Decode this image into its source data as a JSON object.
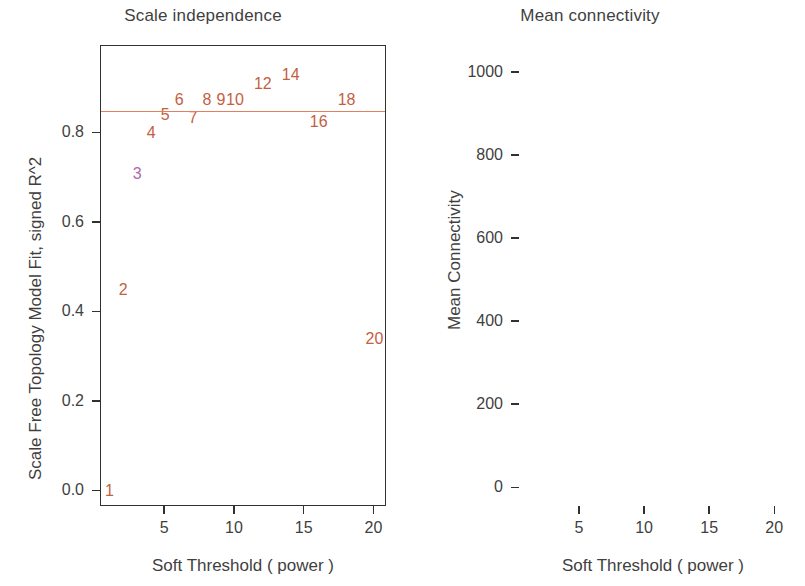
{
  "figure": {
    "width": 805,
    "height": 586,
    "point_color": "#c4603f",
    "threshold_line_color": "#e08060",
    "axis_color": "#32322c"
  },
  "chart_data": [
    {
      "type": "scatter",
      "panel": "left",
      "title": "Scale independence",
      "xlabel": "Soft Threshold ( power )",
      "ylabel": "Scale Free Topology Model Fit, signed R^2",
      "xlim": [
        0.4,
        20.9
      ],
      "ylim": [
        -0.035,
        0.995
      ],
      "xticks": [
        5,
        10,
        15,
        20
      ],
      "xtick_labels": [
        "5",
        "10",
        "15",
        "20"
      ],
      "yticks": [
        0.0,
        0.2,
        0.4,
        0.6,
        0.8
      ],
      "ytick_labels": [
        "0.0",
        "0.2",
        "0.4",
        "0.6",
        "0.8"
      ],
      "grid": false,
      "legend": "none",
      "point_marker": "text-label",
      "annotations": [
        {
          "label": "0.85 threshold line",
          "type": "hline",
          "y": 0.85
        }
      ],
      "x": [
        1,
        2,
        3,
        4,
        5,
        6,
        7,
        8,
        9,
        10,
        12,
        14,
        16,
        18,
        20
      ],
      "values": [
        0.0,
        0.45,
        0.71,
        0.8,
        0.84,
        0.875,
        0.835,
        0.875,
        0.875,
        0.875,
        0.91,
        0.93,
        0.825,
        0.875,
        0.34
      ],
      "labels": [
        "1",
        "2",
        "3",
        "4",
        "5",
        "6",
        "7",
        "8",
        "9",
        "10",
        "12",
        "14",
        "16",
        "18",
        "20"
      ]
    },
    {
      "type": "scatter",
      "panel": "right",
      "title": "Mean connectivity",
      "xlabel": "Soft Threshold ( power )",
      "ylabel": "Mean Connectivity",
      "xlim": [
        0.4,
        20.9
      ],
      "ylim": [
        -45,
        1065
      ],
      "xticks": [
        5,
        10,
        15,
        20
      ],
      "xtick_labels": [
        "5",
        "10",
        "15",
        "20"
      ],
      "yticks": [
        0,
        200,
        400,
        600,
        800,
        1000
      ],
      "ytick_labels": [
        "0",
        "200",
        "400",
        "600",
        "800",
        "1000"
      ],
      "grid": false,
      "legend": "none",
      "point_marker": "text-label",
      "annotations": [],
      "x": [
        1,
        2,
        3,
        4,
        5,
        6,
        7,
        8,
        9,
        10,
        12,
        14,
        16,
        18,
        20
      ],
      "values": [
        1010,
        340,
        130,
        62,
        38,
        24,
        18,
        14,
        12,
        10,
        8,
        7,
        6,
        5,
        4
      ],
      "labels": [
        "1",
        "2",
        "3",
        "4",
        "5",
        "6",
        "7",
        "8",
        "9",
        "10",
        "12",
        "14",
        "16",
        "18",
        "20"
      ]
    }
  ]
}
